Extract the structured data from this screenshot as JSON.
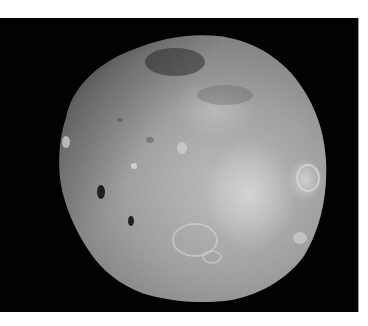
{
  "image": {
    "subject": "Phobos moon photograph",
    "caption": "Grayscale image of a cratered, irregular moon on black background",
    "colors": {
      "page_background": "#ffffff",
      "space_background": "#020202",
      "surface_light": "#b8b8b8",
      "surface_mid": "#8a8a8a",
      "surface_dark": "#3a3a3a",
      "frame_border": "#9a9a9a"
    }
  }
}
